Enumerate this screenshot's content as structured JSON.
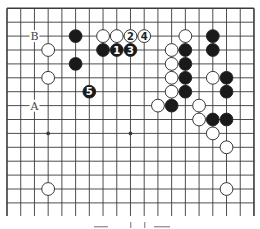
{
  "diagram": {
    "type": "go-board-fragment",
    "grid": {
      "columns": 19,
      "rows_visible": 15,
      "origin_x": 7,
      "origin_y": 8.3,
      "spacing_x": 13.72,
      "spacing_y": 13.9,
      "extend_bottom_to": 216
    },
    "colors": {
      "line": "#3a3a3a",
      "black_stone": "#1a1a1a",
      "white_stone": "#ffffff",
      "label_text": "#444444"
    },
    "star_points": [
      [
        3,
        3
      ],
      [
        9,
        3
      ],
      [
        15,
        3
      ],
      [
        3,
        9
      ],
      [
        9,
        9
      ],
      [
        15,
        9
      ]
    ],
    "stones": [
      {
        "color": "black",
        "col": 5,
        "row": 2
      },
      {
        "color": "white",
        "col": 7,
        "row": 2
      },
      {
        "color": "white",
        "col": 8,
        "row": 2
      },
      {
        "color": "white",
        "col": 9,
        "row": 2,
        "label": "2"
      },
      {
        "color": "white",
        "col": 10,
        "row": 2,
        "label": "4"
      },
      {
        "color": "white",
        "col": 13,
        "row": 2
      },
      {
        "color": "black",
        "col": 15,
        "row": 2
      },
      {
        "color": "white",
        "col": 3,
        "row": 3
      },
      {
        "color": "black",
        "col": 7,
        "row": 3
      },
      {
        "color": "black",
        "col": 8,
        "row": 3,
        "label": "1"
      },
      {
        "color": "black",
        "col": 9,
        "row": 3,
        "label": "3"
      },
      {
        "color": "white",
        "col": 12,
        "row": 3
      },
      {
        "color": "black",
        "col": 13,
        "row": 3
      },
      {
        "color": "black",
        "col": 15,
        "row": 3
      },
      {
        "color": "black",
        "col": 5,
        "row": 4
      },
      {
        "color": "white",
        "col": 12,
        "row": 4
      },
      {
        "color": "black",
        "col": 13,
        "row": 4
      },
      {
        "color": "white",
        "col": 3,
        "row": 5
      },
      {
        "color": "white",
        "col": 12,
        "row": 5
      },
      {
        "color": "black",
        "col": 13,
        "row": 5
      },
      {
        "color": "white",
        "col": 15,
        "row": 5
      },
      {
        "color": "black",
        "col": 16,
        "row": 5
      },
      {
        "color": "black",
        "col": 6,
        "row": 6,
        "label": "5"
      },
      {
        "color": "white",
        "col": 12,
        "row": 6
      },
      {
        "color": "black",
        "col": 13,
        "row": 6
      },
      {
        "color": "black",
        "col": 16,
        "row": 6
      },
      {
        "color": "white",
        "col": 11,
        "row": 7
      },
      {
        "color": "black",
        "col": 12,
        "row": 7
      },
      {
        "color": "white",
        "col": 14,
        "row": 7
      },
      {
        "color": "white",
        "col": 14,
        "row": 8
      },
      {
        "color": "black",
        "col": 15,
        "row": 8
      },
      {
        "color": "black",
        "col": 16,
        "row": 8
      },
      {
        "color": "white",
        "col": 15,
        "row": 9
      },
      {
        "color": "white",
        "col": 16,
        "row": 10
      },
      {
        "color": "white",
        "col": 3,
        "row": 13
      },
      {
        "color": "white",
        "col": 16,
        "row": 13
      }
    ],
    "markers": [
      {
        "text": "B",
        "col": 2,
        "row": 2
      },
      {
        "text": "A",
        "col": 2,
        "row": 7
      }
    ]
  }
}
